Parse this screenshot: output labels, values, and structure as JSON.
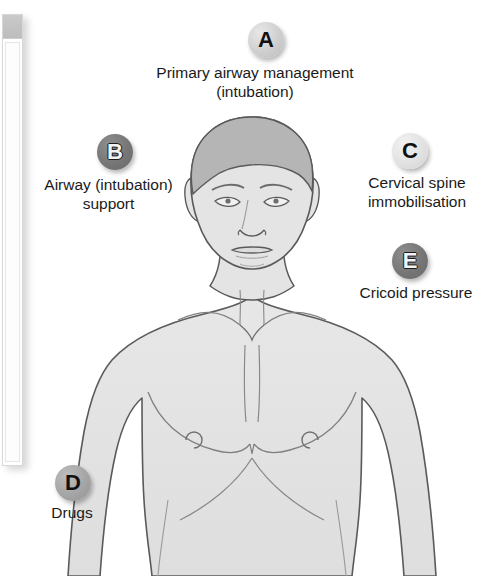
{
  "diagram": {
    "colors": {
      "background": "#ffffff",
      "skin_fill": "#e4e4e4",
      "hair_fill": "#b5b5b5",
      "outline": "#5a5a5a",
      "detail_line": "#8a8a8a",
      "text": "#1a1a1a",
      "badge_light": "#cfcfcf",
      "badge_lighter": "#e2e2e2",
      "badge_mid": "#a5a5a5",
      "badge_dark": "#767676"
    },
    "callouts": [
      {
        "key": "A",
        "badge_label": "A",
        "badge_tone": "light",
        "text": "Primary airway management\n(intubation)",
        "position": "top-center"
      },
      {
        "key": "B",
        "badge_label": "B",
        "badge_tone": "dark",
        "text": "Airway (intubation)\nsupport",
        "position": "upper-left"
      },
      {
        "key": "C",
        "badge_label": "C",
        "badge_tone": "lighter",
        "text": "Cervical spine\nimmobilisation",
        "position": "upper-right"
      },
      {
        "key": "D",
        "badge_label": "D",
        "badge_tone": "mid",
        "text": "Drugs",
        "position": "lower-left"
      },
      {
        "key": "E",
        "badge_label": "E",
        "badge_tone": "dark",
        "text": "Cricoid pressure",
        "position": "mid-right"
      }
    ]
  },
  "panel_edge": {
    "name": "adjacent-window-edge",
    "visible": true
  }
}
